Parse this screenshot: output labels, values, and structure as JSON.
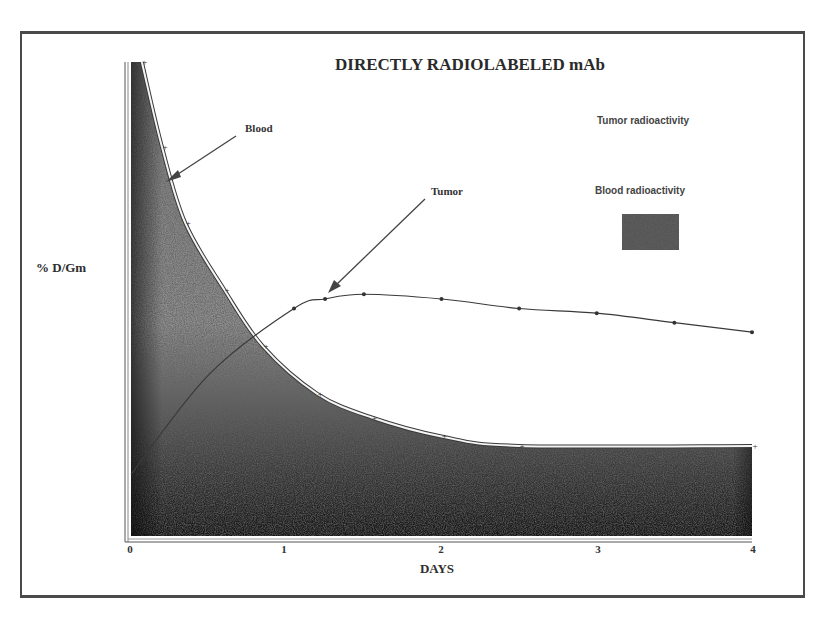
{
  "chart_data": {
    "type": "area",
    "title": "DIRECTLY RADIOLABELED mAb",
    "xlabel": "DAYS",
    "ylabel": "% D/Gm",
    "x_ticks": [
      "0",
      "1",
      "2",
      "3",
      "4"
    ],
    "xlim": [
      0,
      4
    ],
    "ylim_relative": [
      0,
      100
    ],
    "y_ticks": [],
    "grid": false,
    "legend_position": "upper right",
    "legend": [
      {
        "label": "Tumor radioactivity",
        "swatch": "none"
      },
      {
        "label": "Blood radioactivity",
        "swatch": "stippled-dark"
      }
    ],
    "annotations": [
      {
        "text": "Blood",
        "arrow_to_series": "Blood"
      },
      {
        "text": "Tumor",
        "arrow_to_series": "Tumor"
      }
    ],
    "series": [
      {
        "name": "Blood",
        "style": "filled stippled area with double-line outline and + markers",
        "x": [
          0.07,
          0.2,
          0.35,
          0.6,
          0.85,
          1.2,
          1.55,
          2.0,
          2.5,
          4.0
        ],
        "values": [
          100,
          82,
          66,
          52,
          40,
          30,
          25,
          21,
          19,
          19
        ]
      },
      {
        "name": "Tumor",
        "style": "thin line with dot markers",
        "x": [
          0.0,
          0.5,
          1.05,
          1.25,
          1.5,
          2.0,
          2.5,
          3.0,
          3.5,
          4.0
        ],
        "values": [
          13,
          34,
          48,
          50,
          51,
          50,
          48,
          47,
          45,
          43
        ]
      }
    ]
  },
  "colors": {
    "ink": "#2a2a2a",
    "area_dark": "#1e1e1e",
    "area_light": "#9a9a9a",
    "frame": "#4a4a4a"
  }
}
